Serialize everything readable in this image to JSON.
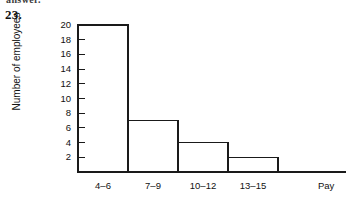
{
  "page": {
    "clipped_header_text": "answer.",
    "question_number": "23."
  },
  "chart_data": {
    "type": "bar",
    "title": "",
    "subtitle": "",
    "xlabel": "Pay",
    "ylabel": "Number of employees",
    "categories": [
      "4–6",
      "7–9",
      "10–12",
      "13–15"
    ],
    "values": [
      20,
      7,
      4,
      2
    ],
    "ylim": [
      0,
      20
    ],
    "ytick_labels": [
      "2",
      "4",
      "6",
      "8",
      "10",
      "12",
      "14",
      "16",
      "18",
      "20"
    ],
    "ytick_values": [
      2,
      4,
      6,
      8,
      10,
      12,
      14,
      16,
      18,
      20
    ],
    "grid": false,
    "legend": false,
    "bar_fill_color": "#ffffff",
    "bar_edge_color": "#1a1a1a",
    "axis_color": "#1a1a1a",
    "background_color": "#ffffff"
  }
}
